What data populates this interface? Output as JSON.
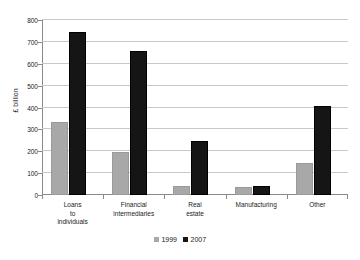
{
  "chart_data": {
    "type": "bar",
    "title": "",
    "subtitle": "",
    "xlabel": "",
    "ylabel": "£ billion",
    "ylim": [
      0,
      800
    ],
    "yticks": [
      0,
      100,
      200,
      300,
      400,
      500,
      600,
      700,
      800
    ],
    "ytick_labels": [
      "0",
      "100",
      "200",
      "300",
      "400",
      "500",
      "600",
      "700",
      "800"
    ],
    "grid": "horizontal",
    "legend_position": "bottom-center",
    "categories": [
      "Loans\nto\nindividuals",
      "Financial\nintermediaries",
      "Real\nestate",
      "Manufacturing",
      "Other"
    ],
    "category_lines": [
      [
        "Loans",
        "to",
        "individuals"
      ],
      [
        "Financial",
        "intermediaries"
      ],
      [
        "Real",
        "estate"
      ],
      [
        "Manufacturing"
      ],
      [
        "Other"
      ]
    ],
    "series": [
      {
        "name": "1999",
        "color": "#a8a8a8",
        "values": [
          335,
          198,
          40,
          35,
          145
        ]
      },
      {
        "name": "2007",
        "color": "#151515",
        "values": [
          745,
          660,
          248,
          43,
          405
        ]
      }
    ]
  },
  "legend": {
    "entries": [
      {
        "label": "1999",
        "color": "#a8a8a8"
      },
      {
        "label": "2007",
        "color": "#151515"
      }
    ]
  },
  "colors": {
    "series_1999": "#a8a8a8",
    "series_2007": "#151515",
    "gridline": "#c8c8c8",
    "axis": "#8a8a8a",
    "background": "#ffffff",
    "text": "#1a1a1a"
  }
}
